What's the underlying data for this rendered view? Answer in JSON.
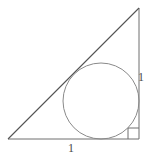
{
  "figure": {
    "name": "right-triangle-with-inscribed-circle",
    "background_color": "#ffffff",
    "stroke_color": "#6e6e6e",
    "hypotenuse_color": "#555555",
    "label_color": "#4a4a4a",
    "stroke_width": 1
  },
  "labels": {
    "vertical_side": "1",
    "horizontal_side": "1"
  },
  "icons": {
    "right_angle_marker": "right-angle-icon"
  },
  "geometry": {
    "triangle": {
      "type": "right-triangle",
      "vertices": [
        {
          "name": "bottom-left",
          "x": 8,
          "y": 139
        },
        {
          "name": "bottom-right",
          "x": 139,
          "y": 139
        },
        {
          "name": "top-right",
          "x": 139,
          "y": 8
        }
      ],
      "right_angle_at": "bottom-right",
      "points_attr": "8,139 139,139 139,8"
    },
    "incircle": {
      "center_x": 101,
      "center_y": 101,
      "radius": 38
    },
    "right_angle_marker": {
      "x": 128,
      "y": 128,
      "size": 11
    }
  }
}
